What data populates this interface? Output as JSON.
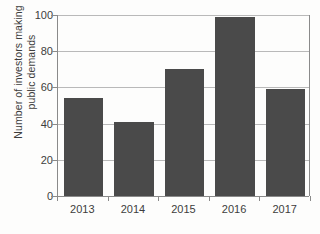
{
  "chart_data": {
    "type": "bar",
    "title": "",
    "subtitle": "",
    "xlabel": "",
    "ylabel": "Number of investors making public demands",
    "ylabel_lines": [
      "Number of investors making",
      "public demands"
    ],
    "categories": [
      "2013",
      "2014",
      "2015",
      "2016",
      "2017"
    ],
    "values": [
      54,
      41,
      70,
      99,
      59
    ],
    "series": [
      {
        "name": "Investors making public demands",
        "values": [
          54,
          41,
          70,
          99,
          59
        ]
      }
    ],
    "ylim": [
      0,
      100
    ],
    "ytick_labels": [
      "0",
      "20",
      "40",
      "60",
      "80",
      "100"
    ],
    "ytick_values": [
      0,
      20,
      40,
      60,
      80,
      100
    ],
    "grid": "horizontal",
    "legend": "none",
    "annotations": [],
    "colors": {
      "bar": "#4a4a4a",
      "gridline": "#b9b9b9",
      "axis": "#8a8a8a",
      "background": "#fdfdfc",
      "text": "#3d3d3d"
    }
  }
}
